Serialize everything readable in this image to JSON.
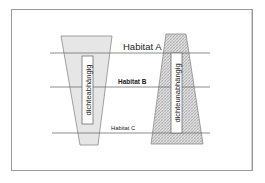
{
  "diagram": {
    "habitats": [
      {
        "label": "Habitat A",
        "y": 53,
        "label_x": 123,
        "label_y": 50,
        "font_size": 10,
        "weight": "normal"
      },
      {
        "label": "Habitat B",
        "y": 87,
        "label_x": 118,
        "label_y": 83,
        "font_size": 6.5,
        "weight": "bold"
      },
      {
        "label": "Habitat C",
        "y": 133,
        "label_x": 111,
        "label_y": 130,
        "font_size": 6,
        "weight": "normal"
      }
    ],
    "left_shape": {
      "label": "dichteabhängig",
      "fill": "#e6e6e6",
      "pattern": "solid"
    },
    "right_shape": {
      "label": "dichteunabhängig",
      "fill": "#d4d4d4",
      "pattern": "hatched"
    },
    "colors": {
      "frame": "#9a9a9a",
      "lines": "#6f6f6f",
      "outline": "#8a8a8a"
    }
  }
}
